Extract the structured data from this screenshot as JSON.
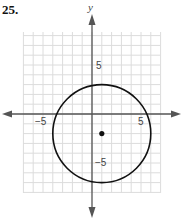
{
  "problem": {
    "number": "25."
  },
  "chart_data": {
    "type": "scatter",
    "title": "",
    "xlabel": "",
    "ylabel": "y",
    "xlim": [
      -7,
      9
    ],
    "ylim": [
      -8,
      8
    ],
    "grid": true,
    "tick_labels": {
      "x": [
        {
          "value": -5,
          "label": "−5"
        },
        {
          "value": 5,
          "label": "5"
        }
      ],
      "y": [
        {
          "value": 5,
          "label": "5"
        },
        {
          "value": -5,
          "label": "−5"
        }
      ]
    },
    "shapes": [
      {
        "kind": "circle",
        "center": [
          1,
          -2
        ],
        "radius": 5
      }
    ],
    "points": [
      {
        "x": 1,
        "y": -2,
        "label": "center"
      }
    ],
    "colors": {
      "grid": "#dcdcdc",
      "axis": "#555555",
      "curve": "#111111"
    }
  }
}
